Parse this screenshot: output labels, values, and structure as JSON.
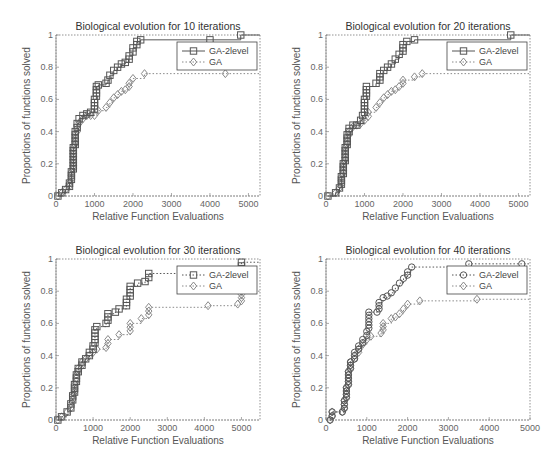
{
  "chart_data": [
    {
      "type": "line",
      "title": "Biological evolution for 10 iterations",
      "xlabel": "Relative Function Evaluations",
      "ylabel": "Proportions of functions solved",
      "xlim": [
        0,
        5300
      ],
      "ylim": [
        0,
        1
      ],
      "xticks": [
        0,
        1000,
        2000,
        3000,
        4000,
        5000
      ],
      "yticks": [
        0,
        0.2,
        0.4,
        0.6,
        0.8,
        1
      ],
      "ytick_labels": [
        "0",
        "0.2",
        "0.4",
        "0.6",
        "0.8",
        "1"
      ],
      "grid": false,
      "legend": "top-right",
      "series": [
        {
          "name": "GA-2level",
          "marker": "square",
          "linestyle": "solid",
          "color": "#555555",
          "x": [
            50,
            150,
            250,
            350,
            400,
            450,
            500,
            550,
            600,
            700,
            800,
            900,
            1000,
            1050,
            1100,
            1300,
            1350,
            1400,
            1500,
            1600,
            1700,
            1800,
            1900,
            2000,
            2100,
            2200,
            4000,
            4800
          ],
          "y": [
            0.0,
            0.02,
            0.04,
            0.08,
            0.15,
            0.3,
            0.4,
            0.45,
            0.48,
            0.5,
            0.51,
            0.52,
            0.6,
            0.68,
            0.69,
            0.7,
            0.72,
            0.75,
            0.78,
            0.8,
            0.82,
            0.83,
            0.87,
            0.92,
            0.96,
            0.97,
            0.97,
            1.0
          ]
        },
        {
          "name": "GA",
          "marker": "diamond",
          "linestyle": "dotted",
          "color": "#8a8a8a",
          "x": [
            50,
            150,
            250,
            350,
            400,
            450,
            500,
            550,
            600,
            700,
            800,
            900,
            1000,
            1100,
            1300,
            1400,
            1500,
            1600,
            1700,
            1800,
            1900,
            2000,
            2300,
            4400
          ],
          "y": [
            0.0,
            0.02,
            0.04,
            0.08,
            0.15,
            0.3,
            0.38,
            0.42,
            0.45,
            0.48,
            0.5,
            0.5,
            0.5,
            0.53,
            0.55,
            0.58,
            0.61,
            0.63,
            0.65,
            0.66,
            0.7,
            0.73,
            0.76,
            0.76
          ]
        }
      ]
    },
    {
      "type": "line",
      "title": "Biological evolution for 20 iterations",
      "xlabel": "Relative Function Evaluations",
      "ylabel": "Proportions of functions solved",
      "xlim": [
        0,
        5300
      ],
      "ylim": [
        0,
        1
      ],
      "xticks": [
        0,
        1000,
        2000,
        3000,
        4000,
        5000
      ],
      "yticks": [
        0,
        0.2,
        0.4,
        0.6,
        0.8,
        1
      ],
      "ytick_labels": [
        "0",
        "0.2",
        "0.4",
        "0.6",
        "0.8",
        "1"
      ],
      "grid": false,
      "legend": "top-right",
      "series": [
        {
          "name": "GA-2level",
          "marker": "square",
          "linestyle": "solid",
          "color": "#555555",
          "x": [
            50,
            250,
            350,
            400,
            450,
            500,
            550,
            600,
            700,
            800,
            900,
            950,
            1000,
            1050,
            1300,
            1400,
            1500,
            1600,
            1700,
            1800,
            1900,
            2000,
            2100,
            2300,
            4800
          ],
          "y": [
            0.0,
            0.02,
            0.05,
            0.12,
            0.2,
            0.3,
            0.38,
            0.42,
            0.44,
            0.44,
            0.47,
            0.5,
            0.6,
            0.68,
            0.7,
            0.76,
            0.78,
            0.8,
            0.82,
            0.85,
            0.88,
            0.94,
            0.96,
            0.97,
            1.0
          ]
        },
        {
          "name": "GA",
          "marker": "diamond",
          "linestyle": "dotted",
          "color": "#8a8a8a",
          "x": [
            50,
            250,
            350,
            400,
            450,
            500,
            550,
            600,
            700,
            800,
            900,
            1000,
            1100,
            1300,
            1400,
            1500,
            1600,
            1700,
            1800,
            1900,
            2000,
            2300,
            2500
          ],
          "y": [
            0.0,
            0.02,
            0.05,
            0.12,
            0.2,
            0.3,
            0.36,
            0.4,
            0.43,
            0.44,
            0.45,
            0.47,
            0.52,
            0.55,
            0.58,
            0.61,
            0.63,
            0.65,
            0.66,
            0.68,
            0.72,
            0.74,
            0.76
          ]
        }
      ]
    },
    {
      "type": "line",
      "title": "Biological evolution for 30 iterations",
      "xlabel": "Relative Function Evaluations",
      "ylabel": "Proportions of functions solved",
      "xlim": [
        0,
        5500
      ],
      "ylim": [
        0,
        1
      ],
      "xticks": [
        0,
        1000,
        2000,
        3000,
        4000,
        5000
      ],
      "yticks": [
        0,
        0.2,
        0.4,
        0.6,
        0.8,
        1
      ],
      "ytick_labels": [
        "0",
        "0.2",
        "0.4",
        "0.6",
        "0.8",
        "1"
      ],
      "grid": false,
      "legend": "top-right",
      "series": [
        {
          "name": "GA-2level",
          "marker": "square",
          "linestyle": "dotted",
          "color": "#555555",
          "x": [
            50,
            150,
            300,
            400,
            450,
            500,
            550,
            600,
            700,
            800,
            900,
            1000,
            1050,
            1100,
            1350,
            1400,
            1600,
            1700,
            1900,
            2000,
            2200,
            2400,
            2500,
            5000
          ],
          "y": [
            0.0,
            0.02,
            0.05,
            0.1,
            0.15,
            0.22,
            0.28,
            0.32,
            0.36,
            0.38,
            0.42,
            0.46,
            0.56,
            0.58,
            0.6,
            0.66,
            0.67,
            0.69,
            0.75,
            0.83,
            0.85,
            0.86,
            0.91,
            0.98
          ]
        },
        {
          "name": "GA",
          "marker": "diamond",
          "linestyle": "dotted",
          "color": "#8a8a8a",
          "x": [
            50,
            150,
            300,
            400,
            450,
            500,
            550,
            600,
            700,
            800,
            900,
            1000,
            1100,
            1350,
            1400,
            1700,
            2000,
            2300,
            2500,
            4100,
            4900,
            5000
          ],
          "y": [
            0.0,
            0.02,
            0.05,
            0.1,
            0.15,
            0.22,
            0.28,
            0.32,
            0.36,
            0.38,
            0.4,
            0.42,
            0.44,
            0.45,
            0.5,
            0.53,
            0.6,
            0.63,
            0.7,
            0.71,
            0.72,
            0.8
          ]
        }
      ]
    },
    {
      "type": "line",
      "title": "Biological evolution for 40 iterations",
      "xlabel": "Relative Function Evaluations",
      "ylabel": "Proportions of functions solved",
      "xlim": [
        0,
        5000
      ],
      "ylim": [
        0,
        1
      ],
      "xticks": [
        0,
        1000,
        2000,
        3000,
        4000,
        5000
      ],
      "yticks": [
        0,
        0.2,
        0.4,
        0.6,
        0.8,
        1
      ],
      "ytick_labels": [
        "0",
        "0.2",
        "0.4",
        "0.6",
        "0.8",
        "1"
      ],
      "grid": false,
      "legend": "top-right",
      "series": [
        {
          "name": "GA-2level",
          "marker": "circle",
          "linestyle": "dotted",
          "color": "#555555",
          "x": [
            100,
            150,
            400,
            450,
            500,
            550,
            600,
            700,
            800,
            900,
            1000,
            1050,
            1250,
            1300,
            1400,
            1500,
            1600,
            1700,
            1800,
            1900,
            2000,
            2100,
            3500,
            4800
          ],
          "y": [
            0.0,
            0.05,
            0.05,
            0.12,
            0.2,
            0.3,
            0.36,
            0.42,
            0.46,
            0.5,
            0.55,
            0.67,
            0.67,
            0.73,
            0.76,
            0.77,
            0.79,
            0.82,
            0.85,
            0.88,
            0.92,
            0.95,
            0.97,
            0.97
          ]
        },
        {
          "name": "GA",
          "marker": "diamond",
          "linestyle": "dotted",
          "color": "#8a8a8a",
          "x": [
            100,
            150,
            400,
            450,
            500,
            550,
            600,
            700,
            800,
            900,
            1000,
            1100,
            1350,
            1400,
            1600,
            1700,
            1800,
            1900,
            2000,
            2300,
            3700
          ],
          "y": [
            0.0,
            0.05,
            0.05,
            0.12,
            0.2,
            0.3,
            0.36,
            0.4,
            0.44,
            0.47,
            0.5,
            0.52,
            0.54,
            0.6,
            0.63,
            0.64,
            0.66,
            0.69,
            0.72,
            0.74,
            0.75
          ]
        }
      ]
    }
  ]
}
